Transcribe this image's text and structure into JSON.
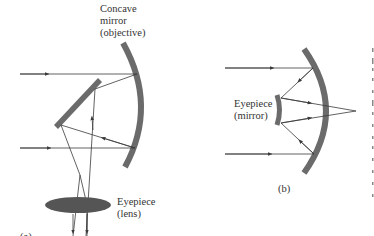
{
  "figure": {
    "panel_a": {
      "caption": "(a)",
      "objective_label": [
        "Concave",
        "mirror",
        "(objective)"
      ],
      "eyepiece_label": [
        "Eyepiece",
        "(lens)"
      ]
    },
    "panel_b": {
      "caption": "(b)",
      "eyepiece_label": [
        "Eyepiece",
        "(mirror)"
      ]
    },
    "colors": {
      "mirror": "#6b6b6b",
      "ray": "#3a3a3a",
      "text": "#333333",
      "background": "#ffffff"
    }
  }
}
